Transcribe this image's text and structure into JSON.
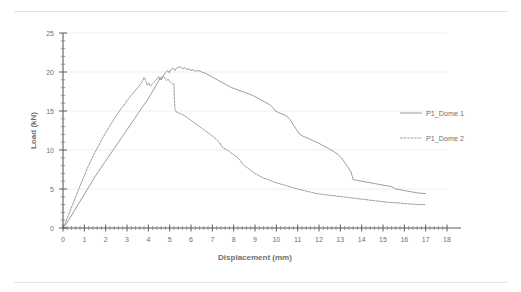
{
  "chart_data": {
    "type": "line",
    "title": "",
    "xlabel": "Displacement (mm)",
    "ylabel": "Load (kN)",
    "xlim": [
      0,
      18
    ],
    "ylim": [
      0,
      25
    ],
    "xticks": [
      0,
      1,
      2,
      3,
      4,
      5,
      6,
      7,
      8,
      9,
      10,
      11,
      12,
      13,
      14,
      15,
      16,
      17,
      18
    ],
    "yticks": [
      0,
      5,
      10,
      15,
      20,
      25
    ],
    "xtick_labels": [
      "0",
      "1",
      "2",
      "3",
      "4",
      "5",
      "6",
      "7",
      "8",
      "9",
      "10",
      "11",
      "12",
      "13",
      "14",
      "15",
      "16",
      "17",
      "18"
    ],
    "ytick_labels": [
      "0",
      "5",
      "10",
      "15",
      "20",
      "25"
    ],
    "x_minor_tick_interval": 0.2,
    "y_minor_tick_interval": 1,
    "grid": "horizontal",
    "legend_position": "right-outside",
    "series": [
      {
        "name": "P1_Dome 1",
        "style": "solid",
        "color": "#8a8a8a",
        "points": [
          [
            0.0,
            0.0
          ],
          [
            0.15,
            0.5
          ],
          [
            0.35,
            1.4
          ],
          [
            0.55,
            2.3
          ],
          [
            0.75,
            3.2
          ],
          [
            0.95,
            4.1
          ],
          [
            1.15,
            5.0
          ],
          [
            1.35,
            5.9
          ],
          [
            1.55,
            6.8
          ],
          [
            1.75,
            7.6
          ],
          [
            1.95,
            8.4
          ],
          [
            2.15,
            9.2
          ],
          [
            2.35,
            10.0
          ],
          [
            2.55,
            10.8
          ],
          [
            2.75,
            11.6
          ],
          [
            2.95,
            12.4
          ],
          [
            3.15,
            13.2
          ],
          [
            3.35,
            14.0
          ],
          [
            3.55,
            14.8
          ],
          [
            3.75,
            15.6
          ],
          [
            3.95,
            16.4
          ],
          [
            4.15,
            17.3
          ],
          [
            4.3,
            18.0
          ],
          [
            4.45,
            18.7
          ],
          [
            4.55,
            19.3
          ],
          [
            4.62,
            19.0
          ],
          [
            4.7,
            19.5
          ],
          [
            4.8,
            19.9
          ],
          [
            4.9,
            20.2
          ],
          [
            4.98,
            19.9
          ],
          [
            5.05,
            20.3
          ],
          [
            5.15,
            20.5
          ],
          [
            5.25,
            20.2
          ],
          [
            5.32,
            20.5
          ],
          [
            5.42,
            20.6
          ],
          [
            5.5,
            20.7
          ],
          [
            5.6,
            20.4
          ],
          [
            5.7,
            20.6
          ],
          [
            5.8,
            20.3
          ],
          [
            5.9,
            20.4
          ],
          [
            6.0,
            20.2
          ],
          [
            6.1,
            20.3
          ],
          [
            6.2,
            20.1
          ],
          [
            6.35,
            20.2
          ],
          [
            6.5,
            20.0
          ],
          [
            6.7,
            19.8
          ],
          [
            6.9,
            19.5
          ],
          [
            7.1,
            19.2
          ],
          [
            7.3,
            18.9
          ],
          [
            7.5,
            18.6
          ],
          [
            7.7,
            18.3
          ],
          [
            7.9,
            18.0
          ],
          [
            8.1,
            17.8
          ],
          [
            8.3,
            17.6
          ],
          [
            8.5,
            17.4
          ],
          [
            8.7,
            17.2
          ],
          [
            8.9,
            17.0
          ],
          [
            9.1,
            16.7
          ],
          [
            9.3,
            16.4
          ],
          [
            9.5,
            16.1
          ],
          [
            9.7,
            15.8
          ],
          [
            9.85,
            15.4
          ],
          [
            9.95,
            15.0
          ],
          [
            10.1,
            14.8
          ],
          [
            10.3,
            14.6
          ],
          [
            10.5,
            14.3
          ],
          [
            10.65,
            13.9
          ],
          [
            10.8,
            13.2
          ],
          [
            10.95,
            12.6
          ],
          [
            11.1,
            12.0
          ],
          [
            11.3,
            11.7
          ],
          [
            11.5,
            11.5
          ],
          [
            11.7,
            11.2
          ],
          [
            11.9,
            11.0
          ],
          [
            12.1,
            10.7
          ],
          [
            12.3,
            10.4
          ],
          [
            12.5,
            10.1
          ],
          [
            12.7,
            9.8
          ],
          [
            12.9,
            9.4
          ],
          [
            13.05,
            9.0
          ],
          [
            13.2,
            8.4
          ],
          [
            13.35,
            7.8
          ],
          [
            13.5,
            7.2
          ],
          [
            13.6,
            6.2
          ],
          [
            13.8,
            6.1
          ],
          [
            14.0,
            6.0
          ],
          [
            14.2,
            5.9
          ],
          [
            14.4,
            5.8
          ],
          [
            14.6,
            5.7
          ],
          [
            14.8,
            5.6
          ],
          [
            15.0,
            5.5
          ],
          [
            15.2,
            5.4
          ],
          [
            15.4,
            5.3
          ],
          [
            15.6,
            5.0
          ],
          [
            15.8,
            4.9
          ],
          [
            16.0,
            4.8
          ],
          [
            16.2,
            4.7
          ],
          [
            16.4,
            4.6
          ],
          [
            16.6,
            4.5
          ],
          [
            16.8,
            4.45
          ],
          [
            17.0,
            4.4
          ]
        ]
      },
      {
        "name": "P1_Dome 2",
        "style": "dashed",
        "color": "#8a8a8a",
        "points": [
          [
            0.0,
            0.0
          ],
          [
            0.12,
            0.7
          ],
          [
            0.28,
            1.8
          ],
          [
            0.45,
            3.0
          ],
          [
            0.62,
            4.2
          ],
          [
            0.8,
            5.4
          ],
          [
            0.98,
            6.6
          ],
          [
            1.15,
            7.7
          ],
          [
            1.32,
            8.7
          ],
          [
            1.5,
            9.7
          ],
          [
            1.68,
            10.6
          ],
          [
            1.85,
            11.5
          ],
          [
            2.02,
            12.3
          ],
          [
            2.2,
            13.1
          ],
          [
            2.38,
            13.9
          ],
          [
            2.55,
            14.6
          ],
          [
            2.72,
            15.3
          ],
          [
            2.9,
            15.9
          ],
          [
            3.05,
            16.5
          ],
          [
            3.2,
            17.0
          ],
          [
            3.35,
            17.5
          ],
          [
            3.5,
            18.0
          ],
          [
            3.62,
            18.4
          ],
          [
            3.72,
            18.8
          ],
          [
            3.8,
            19.3
          ],
          [
            3.88,
            18.9
          ],
          [
            3.95,
            18.3
          ],
          [
            4.02,
            18.6
          ],
          [
            4.1,
            18.2
          ],
          [
            4.2,
            18.5
          ],
          [
            4.3,
            18.8
          ],
          [
            4.4,
            19.1
          ],
          [
            4.48,
            19.4
          ],
          [
            4.55,
            19.0
          ],
          [
            4.62,
            19.3
          ],
          [
            4.7,
            19.5
          ],
          [
            4.78,
            19.2
          ],
          [
            4.85,
            18.9
          ],
          [
            4.92,
            19.1
          ],
          [
            5.0,
            18.8
          ],
          [
            5.08,
            18.6
          ],
          [
            5.15,
            18.4
          ],
          [
            5.2,
            18.5
          ],
          [
            5.22,
            16.5
          ],
          [
            5.25,
            15.2
          ],
          [
            5.3,
            14.9
          ],
          [
            5.4,
            14.8
          ],
          [
            5.55,
            14.6
          ],
          [
            5.7,
            14.4
          ],
          [
            5.85,
            14.1
          ],
          [
            6.0,
            13.8
          ],
          [
            6.15,
            13.5
          ],
          [
            6.3,
            13.2
          ],
          [
            6.45,
            12.9
          ],
          [
            6.6,
            12.6
          ],
          [
            6.75,
            12.3
          ],
          [
            6.9,
            12.0
          ],
          [
            7.05,
            11.7
          ],
          [
            7.2,
            11.3
          ],
          [
            7.35,
            10.9
          ],
          [
            7.45,
            10.4
          ],
          [
            7.55,
            10.2
          ],
          [
            7.7,
            10.0
          ],
          [
            7.85,
            9.7
          ],
          [
            8.0,
            9.4
          ],
          [
            8.15,
            9.1
          ],
          [
            8.3,
            8.7
          ],
          [
            8.42,
            8.2
          ],
          [
            8.55,
            7.9
          ],
          [
            8.7,
            7.6
          ],
          [
            8.85,
            7.3
          ],
          [
            9.0,
            7.0
          ],
          [
            9.2,
            6.7
          ],
          [
            9.4,
            6.4
          ],
          [
            9.6,
            6.2
          ],
          [
            9.8,
            6.0
          ],
          [
            10.0,
            5.8
          ],
          [
            10.25,
            5.6
          ],
          [
            10.5,
            5.4
          ],
          [
            10.75,
            5.2
          ],
          [
            11.0,
            5.0
          ],
          [
            11.3,
            4.8
          ],
          [
            11.6,
            4.6
          ],
          [
            11.9,
            4.4
          ],
          [
            12.2,
            4.3
          ],
          [
            12.5,
            4.2
          ],
          [
            12.8,
            4.1
          ],
          [
            13.1,
            4.0
          ],
          [
            13.4,
            3.9
          ],
          [
            13.7,
            3.8
          ],
          [
            14.0,
            3.7
          ],
          [
            14.3,
            3.6
          ],
          [
            14.6,
            3.5
          ],
          [
            14.9,
            3.4
          ],
          [
            15.2,
            3.3
          ],
          [
            15.5,
            3.25
          ],
          [
            15.8,
            3.2
          ],
          [
            16.1,
            3.1
          ],
          [
            16.4,
            3.05
          ],
          [
            16.7,
            3.0
          ],
          [
            16.95,
            3.0
          ]
        ]
      }
    ]
  }
}
